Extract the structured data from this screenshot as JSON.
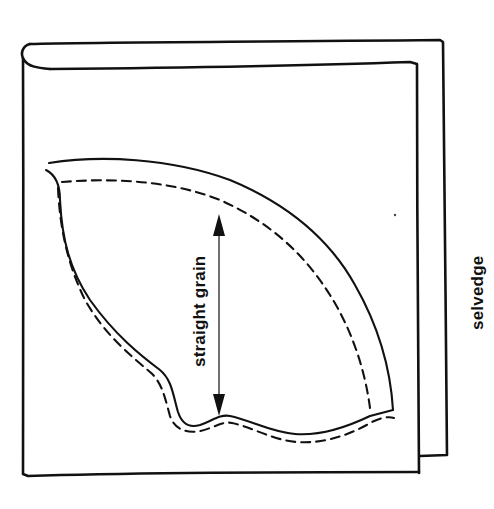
{
  "diagram": {
    "type": "sewing pattern layout",
    "labels": {
      "grain_line": "straight grain",
      "selvedge": "selvedge"
    },
    "elements": {
      "fabric": "folded fabric (two layers, fold at top-left)",
      "pattern_piece": "curved pattern piece with solid cutting line",
      "seam_line": "dashed seam allowance line",
      "grain_arrow": "double-headed vertical arrow"
    },
    "colors": {
      "ink": "#111111",
      "background": "#ffffff"
    }
  }
}
